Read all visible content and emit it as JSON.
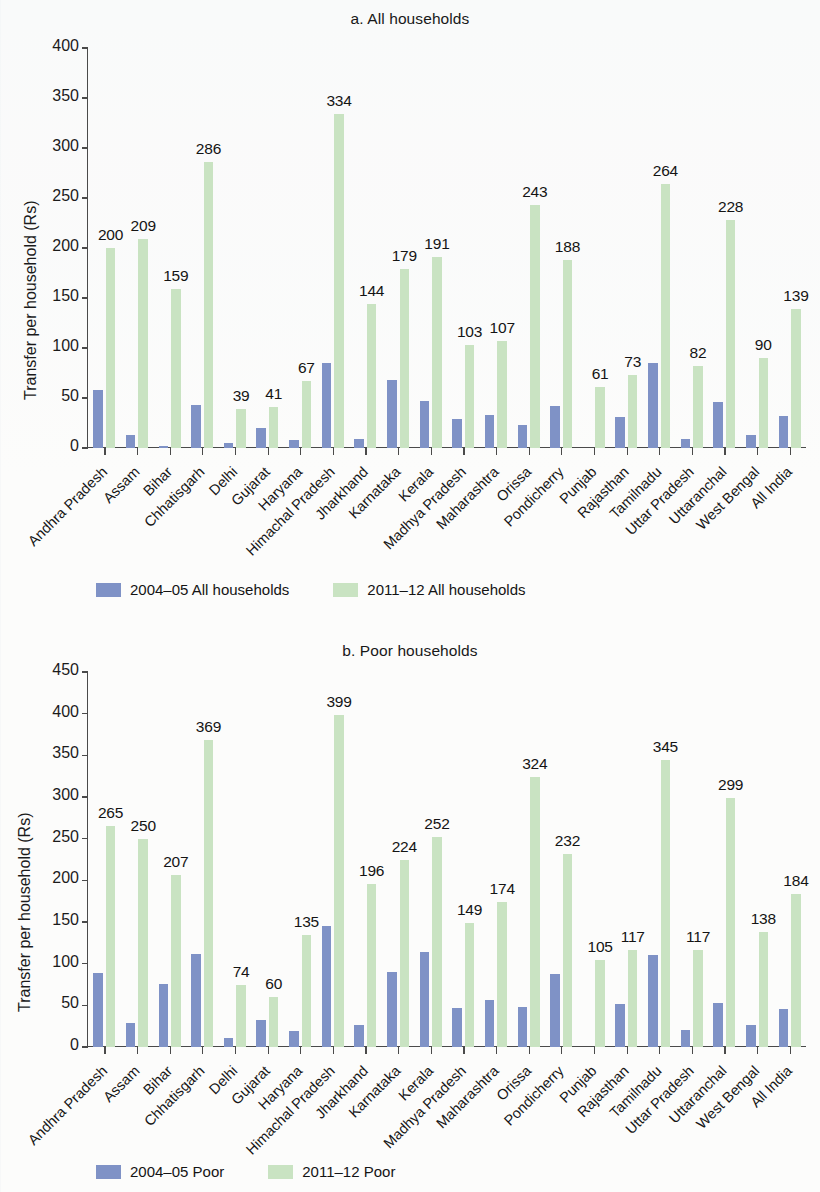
{
  "chart_data": [
    {
      "type": "bar",
      "title": "a. All households",
      "xlabel": "",
      "ylabel": "Transfer per household (Rs)",
      "ylim": [
        0,
        400
      ],
      "yticks": [
        0,
        50,
        100,
        150,
        200,
        250,
        300,
        350,
        400
      ],
      "grid": false,
      "legend_position": "bottom-left",
      "categories": [
        "Andhra Pradesh",
        "Assam",
        "Bihar",
        "Chhatisgarh",
        "Delhi",
        "Gujarat",
        "Haryana",
        "Himachal Pradesh",
        "Jharkhand",
        "Karnataka",
        "Kerala",
        "Madhya Pradesh",
        "Maharashtra",
        "Orissa",
        "Pondicherry",
        "Punjab",
        "Rajasthan",
        "Tamilnadu",
        "Uttar Pradesh",
        "Uttaranchal",
        "West Bengal",
        "All India"
      ],
      "series": [
        {
          "name": "2004-05 All households",
          "color": "#7f92c6",
          "values": [
            58,
            13,
            2,
            43,
            5,
            20,
            8,
            85,
            9,
            68,
            47,
            29,
            33,
            23,
            42,
            null,
            31,
            85,
            9,
            46,
            13,
            32
          ]
        },
        {
          "name": "2011-12 All households",
          "color": "#c9e3c2",
          "values": [
            200,
            209,
            159,
            286,
            39,
            41,
            67,
            334,
            144,
            179,
            191,
            103,
            107,
            243,
            188,
            61,
            73,
            264,
            82,
            228,
            90,
            139
          ],
          "labels": [
            "200",
            "209",
            "159",
            "286",
            "39",
            "41",
            "67",
            "334",
            "144",
            "179",
            "191",
            "103",
            "107",
            "243",
            "188",
            "61",
            "73",
            "264",
            "82",
            "228",
            "90",
            "139"
          ]
        }
      ]
    },
    {
      "type": "bar",
      "title": "b. Poor households",
      "xlabel": "",
      "ylabel": "Transfer per household (Rs)",
      "ylim": [
        0,
        450
      ],
      "yticks": [
        0,
        50,
        100,
        150,
        200,
        250,
        300,
        350,
        400,
        450
      ],
      "grid": false,
      "legend_position": "bottom-left",
      "categories": [
        "Andhra Pradesh",
        "Assam",
        "Bihar",
        "Chhatisgarh",
        "Delhi",
        "Gujarat",
        "Haryana",
        "Himachal Pradesh",
        "Jharkhand",
        "Karnataka",
        "Kerala",
        "Madhya Pradesh",
        "Maharashtra",
        "Orissa",
        "Pondicherry",
        "Punjab",
        "Rajasthan",
        "Tamilnadu",
        "Uttar Pradesh",
        "Uttaranchal",
        "West Bengal",
        "All India"
      ],
      "series": [
        {
          "name": "2004-05 Poor",
          "color": "#7f92c6",
          "values": [
            89,
            29,
            76,
            112,
            11,
            32,
            19,
            145,
            27,
            90,
            114,
            47,
            57,
            48,
            88,
            null,
            52,
            111,
            21,
            53,
            27,
            46
          ]
        },
        {
          "name": "2011-12 Poor",
          "color": "#c9e3c2",
          "values": [
            265,
            250,
            207,
            369,
            74,
            60,
            135,
            399,
            196,
            224,
            252,
            149,
            174,
            324,
            232,
            105,
            117,
            345,
            117,
            299,
            138,
            184
          ],
          "labels": [
            "265",
            "250",
            "207",
            "369",
            "74",
            "60",
            "135",
            "399",
            "196",
            "224",
            "252",
            "149",
            "174",
            "324",
            "232",
            "105",
            "117",
            "345",
            "117",
            "299",
            "138",
            "184"
          ]
        }
      ]
    }
  ],
  "panel_a": {
    "title": "a. All households",
    "ylabel": "Transfer per household (Rs)",
    "legend": {
      "blue_label": "2004–05 All households",
      "green_label": "2011–12 All households"
    }
  },
  "panel_b": {
    "title": "b. Poor households",
    "ylabel": "Transfer per household (Rs)",
    "legend": {
      "blue_label": "2004–05 Poor",
      "green_label": "2011–12 Poor"
    }
  },
  "colors": {
    "series_2004_05": "#7f92c6",
    "series_2011_12": "#c9e3c2",
    "axis": "#4a4a4a",
    "text": "#1b1b1b",
    "background": "#fcfcfb"
  }
}
